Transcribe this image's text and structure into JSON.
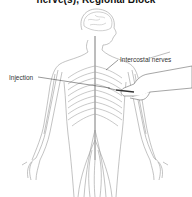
{
  "title": "nerve(s), Regional Block",
  "labels": {
    "intercostal": "Intercostal nerves",
    "injection": "Injection"
  },
  "colors": {
    "line": "#8a8a8a",
    "text": "#333333",
    "title": "#111111"
  }
}
